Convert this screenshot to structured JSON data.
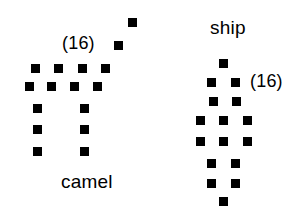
{
  "figure": {
    "title": "",
    "background_color": "#ffffff",
    "dot_color": "#000000",
    "width": 295,
    "height": 209
  },
  "items": [
    {
      "id": "camel",
      "label": "camel",
      "count_label": "(16)",
      "label_position": {
        "x": 61,
        "y": 172
      },
      "count_position": {
        "x": 62,
        "y": 34
      },
      "dot_size": 9,
      "dot_count": 16,
      "dots": [
        {
          "x": 128,
          "y": 18
        },
        {
          "x": 114,
          "y": 41
        },
        {
          "x": 31,
          "y": 64
        },
        {
          "x": 54,
          "y": 64
        },
        {
          "x": 78,
          "y": 64
        },
        {
          "x": 101,
          "y": 64
        },
        {
          "x": 25,
          "y": 82
        },
        {
          "x": 47,
          "y": 82
        },
        {
          "x": 70,
          "y": 82
        },
        {
          "x": 93,
          "y": 82
        },
        {
          "x": 33,
          "y": 104
        },
        {
          "x": 80,
          "y": 104
        },
        {
          "x": 33,
          "y": 125
        },
        {
          "x": 80,
          "y": 125
        },
        {
          "x": 33,
          "y": 147
        },
        {
          "x": 80,
          "y": 147
        }
      ]
    },
    {
      "id": "ship",
      "label": "ship",
      "count_label": "(16)",
      "label_position": {
        "x": 210,
        "y": 18
      },
      "count_position": {
        "x": 250,
        "y": 72
      },
      "dot_size": 9,
      "dot_count": 16,
      "dots": [
        {
          "x": 219,
          "y": 59
        },
        {
          "x": 207,
          "y": 78
        },
        {
          "x": 231,
          "y": 78
        },
        {
          "x": 209,
          "y": 97
        },
        {
          "x": 232,
          "y": 97
        },
        {
          "x": 196,
          "y": 116
        },
        {
          "x": 219,
          "y": 116
        },
        {
          "x": 243,
          "y": 116
        },
        {
          "x": 196,
          "y": 137
        },
        {
          "x": 219,
          "y": 137
        },
        {
          "x": 243,
          "y": 137
        },
        {
          "x": 207,
          "y": 159
        },
        {
          "x": 231,
          "y": 159
        },
        {
          "x": 207,
          "y": 179
        },
        {
          "x": 231,
          "y": 179
        },
        {
          "x": 219,
          "y": 197
        }
      ]
    }
  ]
}
